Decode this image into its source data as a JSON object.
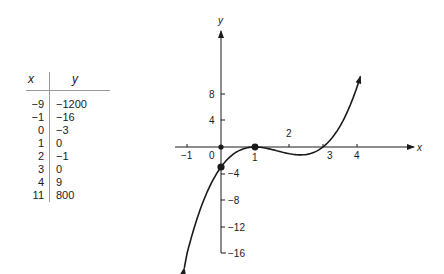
{
  "table": {
    "headers": {
      "x": "x",
      "y": "y"
    },
    "rows": [
      {
        "x": "−9",
        "y": "−1200"
      },
      {
        "x": "−1",
        "y": "−16"
      },
      {
        "x": "0",
        "y": "−3"
      },
      {
        "x": "1",
        "y": "0"
      },
      {
        "x": "2",
        "y": "−1"
      },
      {
        "x": "3",
        "y": "0"
      },
      {
        "x": "4",
        "y": "9"
      },
      {
        "x": "11",
        "y": "800"
      }
    ]
  },
  "chart_data": {
    "type": "line",
    "title": "",
    "xlabel": "x",
    "ylabel": "y",
    "function": "y = (x - 1)^2 (x - 3)",
    "x_ticks": [
      "−1",
      "0",
      "1",
      "2",
      "3",
      "4"
    ],
    "y_ticks": [
      "8",
      "4",
      "−4",
      "−8",
      "−12",
      "−16"
    ],
    "xlim": [
      -1.2,
      4.1
    ],
    "ylim": [
      -16,
      12
    ],
    "grid": false,
    "legend": null,
    "series": [
      {
        "name": "curve",
        "x": [
          -1,
          0,
          1,
          2,
          3,
          4
        ],
        "y": [
          -16,
          -3,
          0,
          -1,
          0,
          9
        ]
      }
    ],
    "marked_points": [
      {
        "x": 0,
        "y": 0
      },
      {
        "x": 0,
        "y": -3
      },
      {
        "x": 1,
        "y": 0
      }
    ],
    "table_values": {
      "x": [
        -9,
        -1,
        0,
        1,
        2,
        3,
        4,
        11
      ],
      "y": [
        -1200,
        -16,
        -3,
        0,
        -1,
        0,
        9,
        800
      ]
    }
  }
}
